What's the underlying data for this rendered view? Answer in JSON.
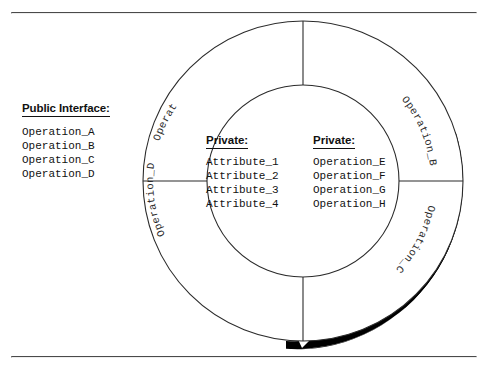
{
  "page": {
    "background_color": "#ffffff",
    "rule_color": "#4a4a4a",
    "ink_color": "#111111",
    "shadow_color": "#000000"
  },
  "legend": {
    "title": "Public Interface:",
    "items": [
      "Operation_A",
      "Operation_B",
      "Operation_C",
      "Operation_D"
    ]
  },
  "diagram": {
    "type": "annulus-object-diagram",
    "center": {
      "x": 303,
      "y": 181
    },
    "outer_radius": 160,
    "inner_radius": 96,
    "ring_labels": [
      "Operation_A",
      "Operation_B",
      "Operation_C",
      "Operation_D"
    ],
    "divider_angles_deg": [
      0,
      90,
      180,
      270
    ],
    "shadow": {
      "present": true,
      "color": "#000000",
      "start_angle_deg": -55,
      "end_angle_deg": 95
    }
  },
  "center_panel": {
    "columns": [
      {
        "heading": "Private:",
        "items": [
          "Attribute_1",
          "Attribute_2",
          "Attribute_3",
          "Attribute_4"
        ]
      },
      {
        "heading": "Private:",
        "items": [
          "Operation_E",
          "Operation_F",
          "Operation_G",
          "Operation_H"
        ]
      }
    ]
  }
}
